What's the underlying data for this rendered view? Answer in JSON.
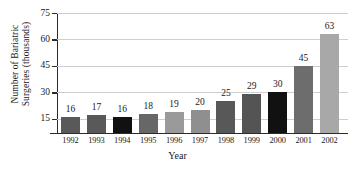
{
  "chart_data": {
    "type": "bar",
    "title": "",
    "xlabel": "Year",
    "ylabel": "Number of Bariatric\nSurgeries (thousands)",
    "categories": [
      "1992",
      "1993",
      "1994",
      "1995",
      "1996",
      "1997",
      "1998",
      "1999",
      "2000",
      "2001",
      "2002"
    ],
    "values": [
      16,
      17,
      16,
      18,
      19,
      20,
      25,
      29,
      30,
      45,
      63
    ],
    "value_labels": [
      "16",
      "17",
      "16",
      "18",
      "19",
      "20",
      "25",
      "29",
      "30",
      "45",
      "63"
    ],
    "bar_colors": [
      "#595959",
      "#595959",
      "#111111",
      "#676767",
      "#9a9a9a",
      "#8f8f8f",
      "#585858",
      "#545454",
      "#111111",
      "#6d6d6d",
      "#a8a8a8"
    ],
    "ytick_labels": [
      "15",
      "30",
      "45",
      "60",
      "75"
    ],
    "ytick_values": [
      15,
      30,
      45,
      60,
      75
    ],
    "ylim": [
      7,
      75
    ],
    "axis_truncated": true,
    "grid": "horizontal",
    "legend": "none",
    "gridline_color": "#cfcfcf",
    "axis_color": "#2b2b2b",
    "background_color": "#ffffff"
  }
}
